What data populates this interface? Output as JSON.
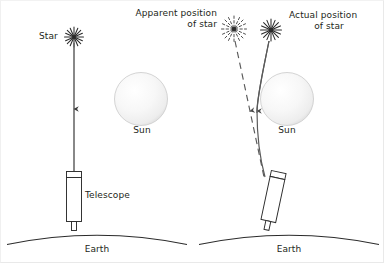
{
  "diagram": {
    "background_color": "#ffffff",
    "line_color": "#231f20",
    "sun_color": "#f4f4f4",
    "sun_edge_color": "#c9c9c9"
  },
  "left_panel": {
    "name": "undeflected-starlight",
    "star_label": "Star",
    "telescope_label": "Telescope",
    "sun_label": "Sun",
    "earth_label": "Earth",
    "star_icon": "star-burst-icon",
    "ray_style": "solid",
    "ray_direction": "downward"
  },
  "right_panel": {
    "name": "deflected-starlight",
    "apparent_label_line1": "Apparent position",
    "apparent_label_line2": "of star",
    "actual_label_line1": "Actual position",
    "actual_label_line2": "of star",
    "sun_label": "Sun",
    "earth_label": "Earth",
    "apparent_star_icon": "dashed-star-burst-icon",
    "actual_star_icon": "star-burst-icon",
    "apparent_ray_style": "dashed",
    "actual_ray_style": "curved-solid"
  }
}
